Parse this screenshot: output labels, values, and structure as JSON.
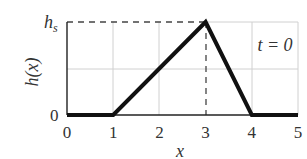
{
  "chart_data": {
    "type": "line",
    "title": "",
    "xlabel": "x",
    "ylabel": "h(x)",
    "annotation": "t = 0",
    "xlim": [
      0,
      5
    ],
    "ylim": [
      0,
      1
    ],
    "xticks": [
      "0",
      "1",
      "2",
      "3",
      "4",
      "5"
    ],
    "yticks": [
      "0",
      "h_s"
    ],
    "ytick_labels_display": {
      "zero": "0",
      "top_main": "h",
      "top_sub": "s"
    },
    "grid": true,
    "series": [
      {
        "name": "h(x)",
        "x": [
          0,
          1,
          3,
          4,
          5
        ],
        "y": [
          0,
          0,
          1,
          0,
          0
        ],
        "color": "#111111"
      }
    ],
    "reference_lines": [
      {
        "type": "horizontal-dashed",
        "y": "h_s",
        "from_x": 0,
        "to_x": 3
      },
      {
        "type": "vertical-dashed",
        "x": 3,
        "from_y": 0,
        "to_y": "h_s"
      }
    ]
  },
  "labels": {
    "x_axis": "x",
    "y_axis": "h(x)",
    "time": "t = 0",
    "hs_main": "h",
    "hs_sub": "s",
    "y_zero": "0"
  }
}
